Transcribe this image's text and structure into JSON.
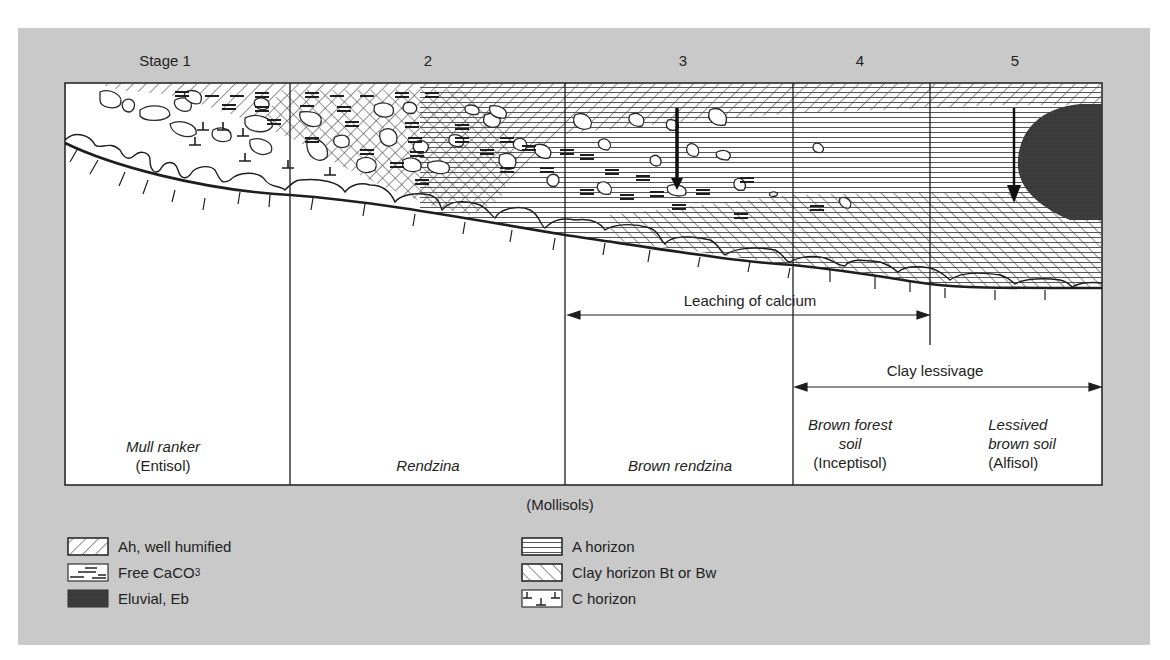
{
  "figure": {
    "background_color": "#c9c9c9",
    "box_color": "#ffffff",
    "line_color": "#1e1e1e",
    "eluvial_color": "#3d3d3d"
  },
  "stages": [
    {
      "label": "Stage 1",
      "x": 165
    },
    {
      "label": "2",
      "x": 428
    },
    {
      "label": "3",
      "x": 683
    },
    {
      "label": "4",
      "x": 860
    },
    {
      "label": "5",
      "x": 1015
    }
  ],
  "processes": [
    {
      "label": "Leaching of calcium",
      "from_stage": "3",
      "to_stage": "5 (start)"
    },
    {
      "label": "Clay lessivage",
      "from_stage": "4",
      "to_stage": "5"
    }
  ],
  "soils": [
    {
      "name": "Mull ranker",
      "class": "(Entisol)"
    },
    {
      "name": "Rendzina",
      "class": ""
    },
    {
      "name": "Brown rendzina",
      "class": ""
    },
    {
      "name": "Brown forest soil",
      "name_line1": "Brown forest",
      "name_line2": "soil",
      "class": "(Inceptisol)"
    },
    {
      "name": "Lessived brown soil",
      "name_line1": "Lessived",
      "name_line2": "brown soil",
      "class": "(Alfisol)"
    }
  ],
  "group_label": "(Mollisols)",
  "legend": [
    {
      "key": "ah",
      "label": "Ah, well humified",
      "pattern": "diagonal-hatch"
    },
    {
      "key": "caco3",
      "label_main": "Free CaCO",
      "label_sub": "3",
      "label": "Free CaCO3",
      "pattern": "dash-marks"
    },
    {
      "key": "eluvial",
      "label": "Eluvial, Eb",
      "pattern": "solid-dark"
    },
    {
      "key": "a",
      "label": "A horizon",
      "pattern": "horizontal-lines"
    },
    {
      "key": "clay",
      "label": "Clay horizon Bt or Bw",
      "pattern": "forward-diagonal-hatch"
    },
    {
      "key": "c",
      "label": "C horizon",
      "pattern": "t-marks"
    }
  ]
}
